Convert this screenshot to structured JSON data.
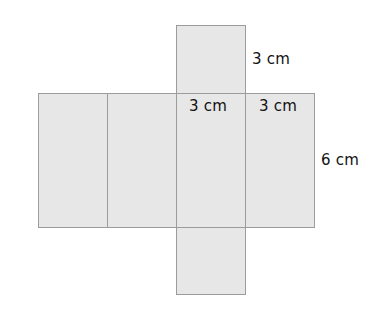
{
  "diagram": {
    "type": "net-of-rectangular-prism",
    "colors": {
      "face_fill": "#e7e7e7",
      "edge": "#9c9c9c",
      "text": "#111111"
    },
    "faces": [
      {
        "id": "top-square",
        "x": 176,
        "y": 25,
        "w": 70,
        "h": 69
      },
      {
        "id": "main-strip",
        "x": 38,
        "y": 93,
        "w": 277,
        "h": 135
      },
      {
        "id": "bottom-square",
        "x": 176,
        "y": 227,
        "w": 70,
        "h": 68
      }
    ],
    "dividers": [
      {
        "id": "divider-1",
        "x": 107,
        "y": 93,
        "h": 135
      },
      {
        "id": "divider-2",
        "x": 176,
        "y": 93,
        "h": 135
      },
      {
        "id": "divider-3",
        "x": 245,
        "y": 93,
        "h": 135
      }
    ],
    "labels": {
      "top_square_side": "3 cm",
      "front_face_width": "3 cm",
      "side_face_width": "3 cm",
      "height": "6 cm"
    }
  }
}
